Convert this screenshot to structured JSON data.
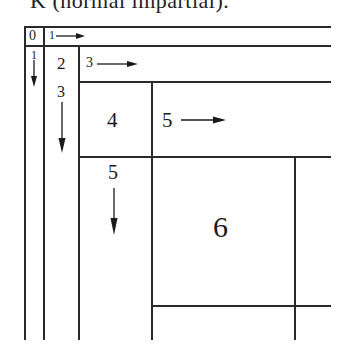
{
  "caption": "K (normal impartial).",
  "cells": {
    "c0": "0",
    "c1_right": "1",
    "c1_down": "1",
    "c2": "2",
    "c3_right": "3",
    "c3_down": "3",
    "c4": "4",
    "c5_right": "5",
    "c5_down": "5",
    "c6": "6"
  },
  "arrows": {
    "right": "arrow-right",
    "down": "arrow-down"
  },
  "colors": {
    "line": "#2a2a2a",
    "text": "#1a1a1a",
    "background": "#ffffff"
  }
}
